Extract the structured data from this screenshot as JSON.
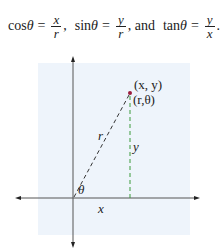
{
  "formula": {
    "cos": {
      "fn": "cos",
      "var": "θ",
      "eq": "=",
      "num": "x",
      "den": "r",
      "sep": ","
    },
    "sin": {
      "fn": "sin",
      "var": "θ",
      "eq": "=",
      "num": "y",
      "den": "r",
      "sep": ", and"
    },
    "tan": {
      "fn": "tan",
      "var": "θ",
      "eq": "=",
      "num": "y",
      "den": "x",
      "sep": "."
    }
  },
  "diagram": {
    "background_color": "#eef4fb",
    "axis_color": "#555555",
    "radius_line_color": "#333333",
    "height_line_color": "#3a9a3a",
    "point_color": "#9b1c3c",
    "labels": {
      "point_cartesian": "(x, y)",
      "point_polar": "(r,θ)",
      "radius": "r",
      "height": "y",
      "base": "x",
      "angle": "θ"
    }
  }
}
